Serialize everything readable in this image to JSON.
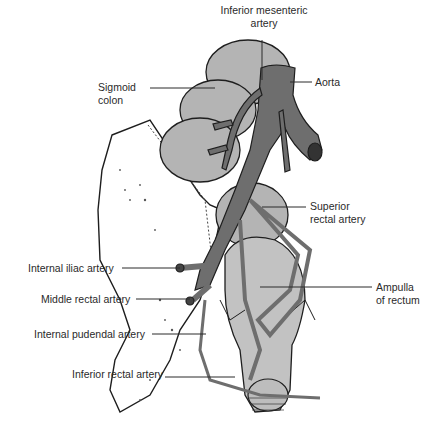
{
  "figure": {
    "colors": {
      "background": "#ffffff",
      "artery_fill": "#6e6e6e",
      "colon_fill": "#b4b4b4",
      "rectum_fill": "#c2c2c2",
      "pelvis_fill": "#ffffff",
      "outline": "#1e1e1e",
      "label_text": "#2a2a2a"
    },
    "labels": {
      "inferior_mesenteric_line1": "Inferior mesenteric",
      "inferior_mesenteric_line2": "artery",
      "aorta": "Aorta",
      "sigmoid_line1": "Sigmoid",
      "sigmoid_line2": "colon",
      "superior_rectal_line1": "Superior",
      "superior_rectal_line2": "rectal artery",
      "ampulla_line1": "Ampulla",
      "ampulla_line2": "of rectum",
      "internal_iliac": "Internal iliac artery",
      "middle_rectal": "Middle rectal artery",
      "internal_pudendal": "Internal pudendal artery",
      "inferior_rectal": "Inferior rectal artery"
    }
  }
}
